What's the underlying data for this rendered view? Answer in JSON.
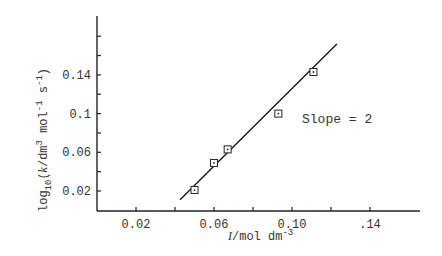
{
  "chart_data": {
    "type": "scatter",
    "title": "",
    "xlabel": "I/mol dm^-3",
    "ylabel": "log10(k/dm^3 mol^-1 s^-1)",
    "xlim": [
      0.0,
      0.16
    ],
    "ylim": [
      0.0,
      0.2
    ],
    "x_ticks": [
      0.02,
      0.04,
      0.06,
      0.08,
      0.1,
      0.12,
      0.14
    ],
    "x_tick_labels": [
      "0.02",
      "0.06",
      "0.10",
      ".14"
    ],
    "x_tick_label_values": [
      0.02,
      0.06,
      0.1,
      0.14
    ],
    "y_ticks": [
      0.02,
      0.04,
      0.06,
      0.08,
      0.1,
      0.12,
      0.14,
      0.16,
      0.18
    ],
    "y_tick_labels": [
      "0.02",
      "0.06",
      "0.1",
      "0.14"
    ],
    "y_tick_label_values": [
      0.02,
      0.06,
      0.1,
      0.14
    ],
    "grid": false,
    "legend": null,
    "series": [
      {
        "name": "data",
        "marker": "square-dot",
        "points": [
          {
            "x": 0.05,
            "y": 0.021
          },
          {
            "x": 0.06,
            "y": 0.049
          },
          {
            "x": 0.067,
            "y": 0.063
          },
          {
            "x": 0.093,
            "y": 0.1
          },
          {
            "x": 0.111,
            "y": 0.143
          }
        ]
      },
      {
        "name": "fit line",
        "type": "line",
        "points": [
          {
            "x": 0.0426,
            "y": 0.011
          },
          {
            "x": 0.123,
            "y": 0.172
          }
        ]
      }
    ],
    "annotations": [
      {
        "text": "Slope = 2",
        "x": 0.127,
        "y": 0.094
      }
    ]
  },
  "labels": {
    "x_axis_title_italic": "I",
    "x_axis_title_rest": "/mol dm",
    "x_axis_title_sup": "-3",
    "y_axis_log": "log",
    "y_axis_sub": "10",
    "y_axis_k": "k",
    "y_axis_dm": "/dm",
    "y_axis_sup3": "3",
    "y_axis_mol": " mol",
    "y_axis_supm1": "-1",
    "y_axis_s": " s",
    "y_axis_supm1b": "-1",
    "y_axis_close": ")",
    "y_axis_open": "(",
    "slope_annotation": "Slope = 2"
  }
}
